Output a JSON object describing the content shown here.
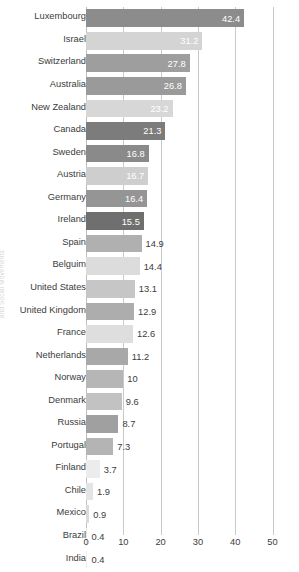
{
  "title": "",
  "side_credit": "and Social Movements",
  "axis": {
    "x_ticks": [
      "0",
      "10",
      "20",
      "30",
      "40",
      "50"
    ],
    "x_min": 0,
    "x_max": 50
  },
  "colors": {
    "background": "#ffffff",
    "gridline": "#c9c9c9",
    "label_text": "#3b3b3b",
    "value_inside": "#ffffff",
    "value_outside": "#3b3b3b"
  },
  "chart_data": {
    "type": "bar",
    "orientation": "horizontal",
    "title": "",
    "xlabel": "",
    "ylabel": "",
    "xlim": [
      0,
      50
    ],
    "grid": true,
    "legend": "none",
    "categories": [
      "Luxembourg",
      "Israel",
      "Switzerland",
      "Australia",
      "New Zealand",
      "Canada",
      "Sweden",
      "Austria",
      "Germany",
      "Ireland",
      "Spain",
      "Belguim",
      "United States",
      "United Kingdom",
      "France",
      "Netherlands",
      "Norway",
      "Denmark",
      "Russia",
      "Portugal",
      "Finland",
      "Chile",
      "Mexico",
      "Brazil",
      "India",
      "China"
    ],
    "values": [
      42.4,
      31.2,
      27.8,
      26.8,
      23.2,
      21.3,
      16.8,
      16.7,
      16.4,
      15.5,
      14.9,
      14.4,
      13.1,
      12.9,
      12.6,
      11.2,
      10,
      9.6,
      8.7,
      7.3,
      3.7,
      1.9,
      0.9,
      0.4,
      0.4,
      0.1
    ],
    "value_labels": [
      "42.4",
      "31.2",
      "27.8",
      "26.8",
      "23.2",
      "21.3",
      "16.8",
      "16.7",
      "16.4",
      "15.5",
      "14.9",
      "14.4",
      "13.1",
      "12.9",
      "12.6",
      "11.2",
      "10",
      "9.6",
      "8.7",
      "7.3",
      "3.7",
      "1.9",
      "0.9",
      "0.4",
      "0.4",
      "0.1"
    ],
    "bar_colors": [
      "#8c8c8c",
      "#d4d4d4",
      "#9e9e9e",
      "#9a9a9a",
      "#d7d7d7",
      "#7c7c7c",
      "#8a8a8a",
      "#cecece",
      "#959595",
      "#6f6f6f",
      "#b0b0b0",
      "#dcdcdc",
      "#c6c6c6",
      "#adadad",
      "#dedede",
      "#a8a8a8",
      "#b6b6b6",
      "#c2c2c2",
      "#a0a0a0",
      "#b4b4b4",
      "#ececec",
      "#e4e4e4",
      "#dadada",
      "#e8e8e8",
      "#ededed",
      "#f0f0f0"
    ],
    "value_label_placement": [
      "inside",
      "inside",
      "inside",
      "inside",
      "inside",
      "inside",
      "inside",
      "inside",
      "inside",
      "inside",
      "outside",
      "outside",
      "outside",
      "outside",
      "outside",
      "outside",
      "outside",
      "outside",
      "outside",
      "outside",
      "outside",
      "outside",
      "outside",
      "outside",
      "outside",
      "outside"
    ]
  }
}
